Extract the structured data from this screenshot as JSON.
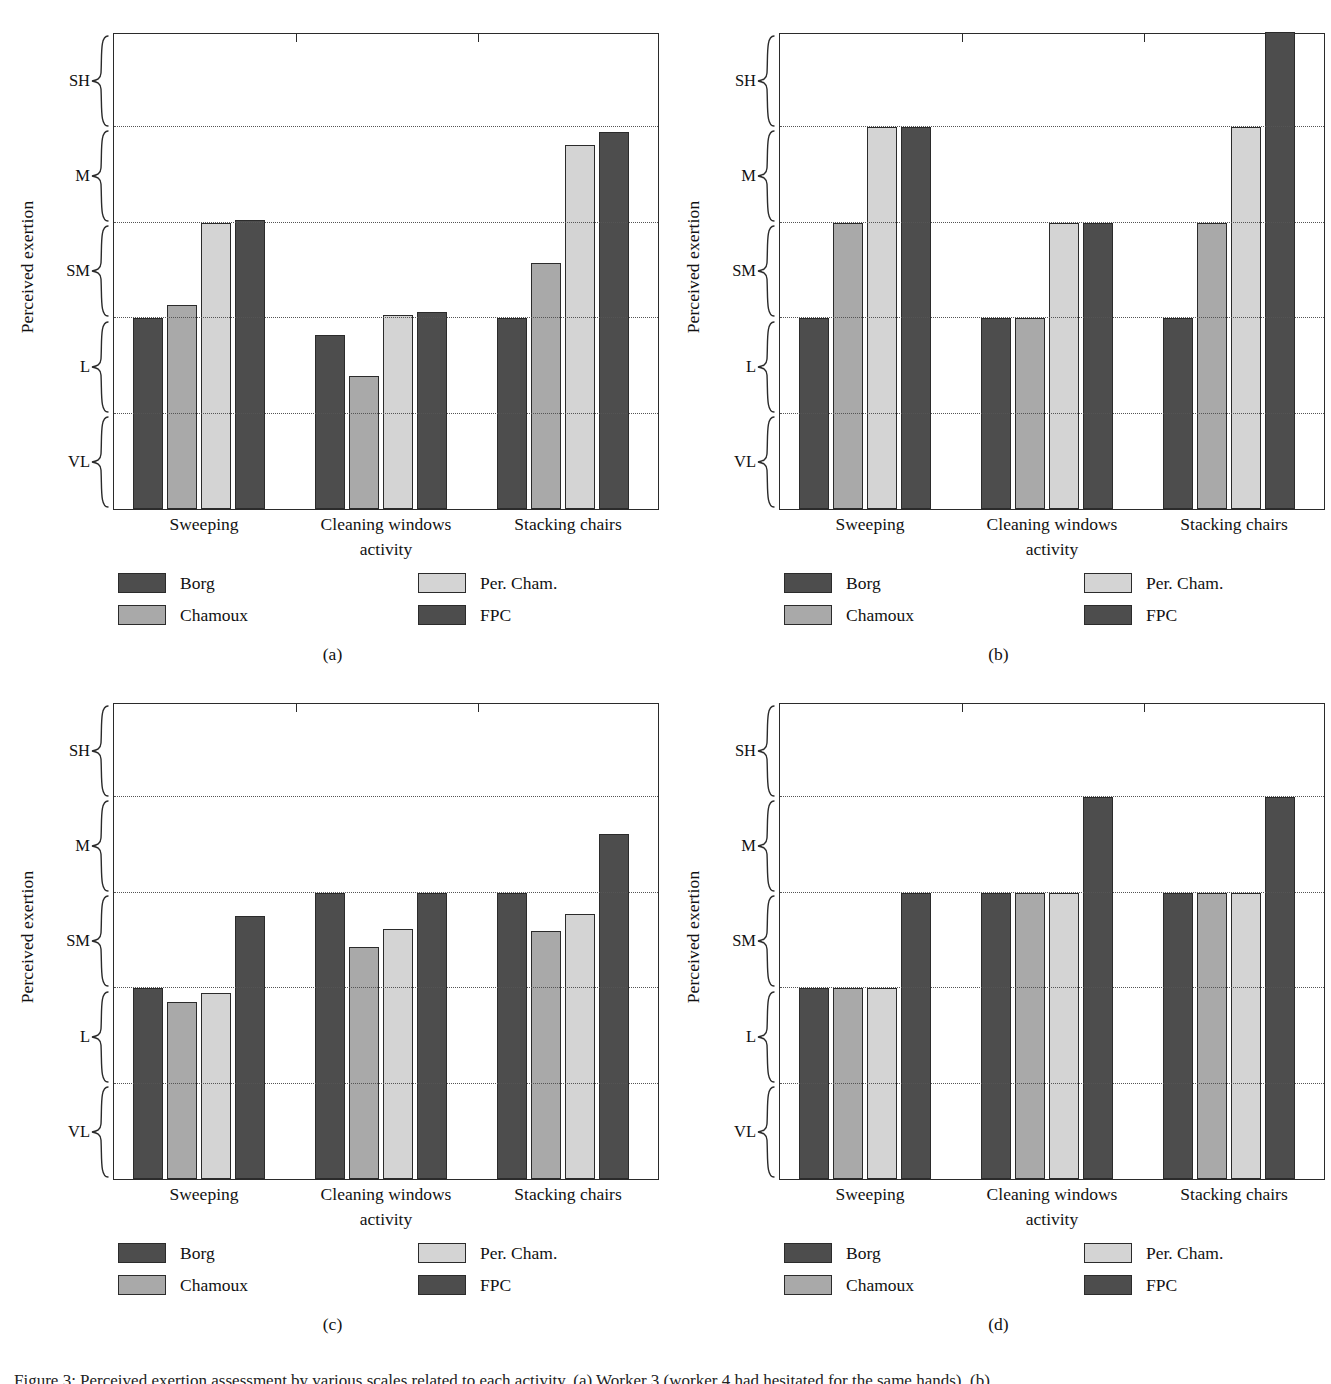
{
  "figure": {
    "caption": "Figure 3: Perceived exertion assessment by various scales related to each activity. (a) Worker 3 (worker 4 had hesitated for the same hands). (b)",
    "axis_title_y": "Perceived exertion",
    "axis_title_x": "activity",
    "y_categories": [
      "SH",
      "M",
      "SM",
      "L",
      "VL"
    ],
    "x_categories": [
      "Sweeping",
      "Cleaning windows",
      "Stacking chairs"
    ],
    "series_names": [
      "Borg",
      "Chamoux",
      "Per. Cham.",
      "FPC"
    ],
    "series_colors": [
      "#4d4d4d",
      "#a9a9a9",
      "#d4d4d4",
      "#4d4d4d"
    ],
    "panel_tags": [
      "(a)",
      "(b)",
      "(c)",
      "(d)"
    ]
  },
  "chart_data": [
    {
      "type": "bar",
      "panel": "(a)",
      "title": "",
      "xlabel": "activity",
      "ylabel": "Perceived exertion",
      "categories": [
        "Sweeping",
        "Cleaning windows",
        "Stacking chairs"
      ],
      "ytick_labels": [
        "VL",
        "L",
        "SM",
        "M",
        "SH"
      ],
      "ylim": [
        0,
        5
      ],
      "grid": true,
      "legend_position": "below",
      "series": [
        {
          "name": "Borg",
          "color": "#4d4d4d",
          "values": [
            2.0,
            1.82,
            2.0
          ]
        },
        {
          "name": "Chamoux",
          "color": "#a9a9a9",
          "values": [
            2.14,
            1.39,
            2.58
          ]
        },
        {
          "name": "Per. Cham.",
          "color": "#d4d4d4",
          "values": [
            3.0,
            2.03,
            3.82
          ]
        },
        {
          "name": "FPC",
          "color": "#4d4d4d",
          "values": [
            3.03,
            2.07,
            3.95
          ]
        }
      ]
    },
    {
      "type": "bar",
      "panel": "(b)",
      "title": "",
      "xlabel": "activity",
      "ylabel": "Perceived exertion",
      "categories": [
        "Sweeping",
        "Cleaning windows",
        "Stacking chairs"
      ],
      "ytick_labels": [
        "VL",
        "L",
        "SM",
        "M",
        "SH"
      ],
      "ylim": [
        0,
        5
      ],
      "grid": true,
      "legend_position": "below",
      "series": [
        {
          "name": "Borg",
          "color": "#4d4d4d",
          "values": [
            2.0,
            2.0,
            2.0
          ]
        },
        {
          "name": "Chamoux",
          "color": "#a9a9a9",
          "values": [
            3.0,
            2.0,
            3.0
          ]
        },
        {
          "name": "Per. Cham.",
          "color": "#d4d4d4",
          "values": [
            4.0,
            3.0,
            4.0
          ]
        },
        {
          "name": "FPC",
          "color": "#4d4d4d",
          "values": [
            4.0,
            3.0,
            5.0
          ]
        }
      ]
    },
    {
      "type": "bar",
      "panel": "(c)",
      "title": "",
      "xlabel": "activity",
      "ylabel": "Perceived exertion",
      "categories": [
        "Sweeping",
        "Cleaning windows",
        "Stacking chairs"
      ],
      "ytick_labels": [
        "VL",
        "L",
        "SM",
        "M",
        "SH"
      ],
      "ylim": [
        0,
        5
      ],
      "grid": true,
      "legend_position": "below",
      "series": [
        {
          "name": "Borg",
          "color": "#4d4d4d",
          "values": [
            2.0,
            3.0,
            3.0
          ]
        },
        {
          "name": "Chamoux",
          "color": "#a9a9a9",
          "values": [
            1.86,
            2.43,
            2.6
          ]
        },
        {
          "name": "Per. Cham.",
          "color": "#d4d4d4",
          "values": [
            1.95,
            2.62,
            2.78
          ]
        },
        {
          "name": "FPC",
          "color": "#4d4d4d",
          "values": [
            2.76,
            3.0,
            3.62
          ]
        }
      ]
    },
    {
      "type": "bar",
      "panel": "(d)",
      "title": "",
      "xlabel": "activity",
      "ylabel": "Perceived exertion",
      "categories": [
        "Sweeping",
        "Cleaning windows",
        "Stacking chairs"
      ],
      "ytick_labels": [
        "VL",
        "L",
        "SM",
        "M",
        "SH"
      ],
      "ylim": [
        0,
        5
      ],
      "grid": true,
      "legend_position": "below",
      "series": [
        {
          "name": "Borg",
          "color": "#4d4d4d",
          "values": [
            2.0,
            3.0,
            3.0
          ]
        },
        {
          "name": "Chamoux",
          "color": "#a9a9a9",
          "values": [
            2.0,
            3.0,
            3.0
          ]
        },
        {
          "name": "Per. Cham.",
          "color": "#d4d4d4",
          "values": [
            2.0,
            3.0,
            3.0
          ]
        },
        {
          "name": "FPC",
          "color": "#4d4d4d",
          "values": [
            3.0,
            4.0,
            4.0
          ]
        }
      ]
    }
  ]
}
